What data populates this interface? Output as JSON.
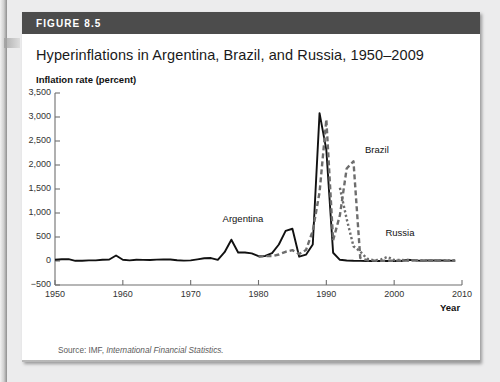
{
  "figure": {
    "number_label": "FIGURE 8.5",
    "title": "Hyperinflations in Argentina, Brazil, and Russia, 1950–2009",
    "source_prefix": "Source: IMF, ",
    "source_italic": "International Financial Statistics."
  },
  "chart_data": {
    "type": "line",
    "title": "Hyperinflations in Argentina, Brazil, and Russia, 1950–2009",
    "subtitle": "Inflation rate (percent)",
    "xlabel": "Year",
    "ylabel": "Inflation rate (percent)",
    "xlim": [
      1950,
      2010
    ],
    "ylim": [
      -500,
      3500
    ],
    "grid": false,
    "legend_position": "inline-annotations",
    "ytick_labels": [
      "3,500",
      "3,000",
      "2,500",
      "2,000",
      "1,500",
      "1,000",
      "500",
      "0",
      "−500"
    ],
    "ytick_values": [
      3500,
      3000,
      2500,
      2000,
      1500,
      1000,
      500,
      0,
      -500
    ],
    "xtick_labels": [
      "1950",
      "1960",
      "1970",
      "1980",
      "1990",
      "2000",
      "2010"
    ],
    "xtick_values": [
      1950,
      1960,
      1970,
      1980,
      1990,
      2000,
      2010
    ],
    "annotations": [
      {
        "text": "Argentina",
        "x": 1975,
        "y": 700
      },
      {
        "text": "Brazil",
        "x": 1996,
        "y": 2150
      },
      {
        "text": "Russia",
        "x": 1999,
        "y": 420
      }
    ],
    "series": [
      {
        "name": "Argentina",
        "style": "solid",
        "color": "#111111",
        "x": [
          1950,
          1951,
          1952,
          1953,
          1954,
          1955,
          1956,
          1957,
          1958,
          1959,
          1960,
          1961,
          1962,
          1963,
          1964,
          1965,
          1966,
          1967,
          1968,
          1969,
          1970,
          1971,
          1972,
          1973,
          1974,
          1975,
          1976,
          1977,
          1978,
          1979,
          1980,
          1981,
          1982,
          1983,
          1984,
          1985,
          1986,
          1987,
          1988,
          1989,
          1990,
          1991,
          1992,
          1993,
          1994,
          1995,
          1996,
          1997,
          1998,
          1999,
          2000,
          2001,
          2002,
          2003,
          2004,
          2005,
          2006,
          2007,
          2008,
          2009
        ],
        "y": [
          25,
          37,
          39,
          4,
          4,
          12,
          13,
          25,
          32,
          114,
          27,
          14,
          26,
          24,
          22,
          29,
          32,
          30,
          16,
          8,
          14,
          35,
          58,
          61,
          24,
          183,
          444,
          176,
          176,
          160,
          101,
          105,
          165,
          344,
          627,
          672,
          90,
          131,
          343,
          3080,
          2314,
          172,
          25,
          11,
          4,
          3,
          0,
          0,
          1,
          -1,
          -1,
          -1,
          26,
          13,
          4,
          10,
          9,
          9,
          8,
          6
        ]
      },
      {
        "name": "Brazil",
        "style": "dashed",
        "color": "#6d6d6d",
        "x": [
          1980,
          1981,
          1982,
          1983,
          1984,
          1985,
          1986,
          1987,
          1988,
          1989,
          1990,
          1991,
          1992,
          1993,
          1994,
          1995,
          1996,
          1997,
          1998,
          1999,
          2000,
          2001,
          2002,
          2003,
          2004,
          2005,
          2006,
          2007,
          2008,
          2009
        ],
        "y": [
          90,
          101,
          101,
          135,
          192,
          226,
          147,
          228,
          629,
          1431,
          2948,
          433,
          952,
          1928,
          2076,
          66,
          16,
          7,
          3,
          5,
          7,
          7,
          8,
          15,
          7,
          7,
          4,
          4,
          6,
          5
        ]
      },
      {
        "name": "Russia",
        "style": "dotted",
        "color": "#6d6d6d",
        "x": [
          1992,
          1993,
          1994,
          1995,
          1996,
          1997,
          1998,
          1999,
          2000,
          2001,
          2002,
          2003,
          2004,
          2005,
          2006,
          2007,
          2008,
          2009
        ],
        "y": [
          1526,
          875,
          308,
          197,
          48,
          15,
          28,
          86,
          21,
          22,
          16,
          14,
          11,
          13,
          10,
          9,
          14,
          12
        ]
      }
    ]
  }
}
